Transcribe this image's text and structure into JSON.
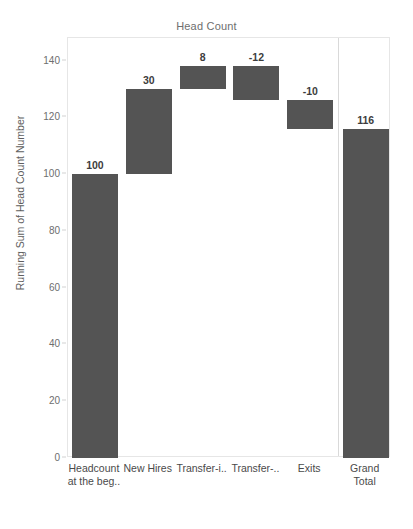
{
  "chart_data": {
    "type": "bar",
    "subtype": "waterfall",
    "title": "Head Count",
    "xlabel": "",
    "ylabel": "Running Sum of Head Count Number",
    "ylim": [
      0,
      148
    ],
    "yticks": [
      0,
      20,
      40,
      60,
      80,
      100,
      120,
      140
    ],
    "ytick_labels": [
      "0",
      "20",
      "40",
      "60",
      "80",
      "100",
      "120",
      "140"
    ],
    "grid": false,
    "legend": null,
    "categories": [
      "Headcount\nat the beg..",
      "New Hires",
      "Transfer-i..",
      "Transfer-..",
      "Exits",
      "Grand\nTotal"
    ],
    "values": [
      100,
      30,
      8,
      -12,
      -10,
      116
    ],
    "value_labels": [
      "100",
      "30",
      "8",
      "-12",
      "-10",
      "116"
    ],
    "running_sum": [
      100,
      130,
      138,
      126,
      116,
      116
    ],
    "bars": [
      {
        "category": "Headcount\nat the beg..",
        "value": 100,
        "label": "100",
        "base": 0,
        "top": 100,
        "is_total": false
      },
      {
        "category": "New Hires",
        "value": 30,
        "label": "30",
        "base": 100,
        "top": 130,
        "is_total": false
      },
      {
        "category": "Transfer-i..",
        "value": 8,
        "label": "8",
        "base": 130,
        "top": 138,
        "is_total": false
      },
      {
        "category": "Transfer-..",
        "value": -12,
        "label": "-12",
        "base": 126,
        "top": 138,
        "is_total": false
      },
      {
        "category": "Exits",
        "value": -10,
        "label": "-10",
        "base": 116,
        "top": 126,
        "is_total": false
      },
      {
        "category": "Grand\nTotal",
        "value": 116,
        "label": "116",
        "base": 0,
        "top": 116,
        "is_total": true
      }
    ],
    "colors": {
      "bar": "#545454",
      "plot_border": "#e6e6e6",
      "title_text": "#6e6e6e",
      "axis_text": "#6e6e6e",
      "label_text": "#3d3d3d",
      "separator": "#d9d9d9",
      "background": "#ffffff"
    }
  }
}
